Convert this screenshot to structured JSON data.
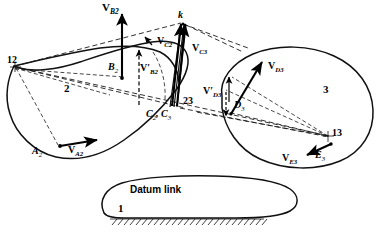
{
  "figure": {
    "background_color": "#ffffff",
    "line_color": "#111111"
  },
  "links": [
    {
      "id": "link2",
      "number_label": "2",
      "name": "link-2"
    },
    {
      "id": "link3",
      "number_label": "3",
      "name": "link-3"
    },
    {
      "id": "link1",
      "number_label": "1",
      "name": "datum-link",
      "text": "Datum link"
    }
  ],
  "datum": {
    "label": "Datum link",
    "number": "1"
  },
  "instant_centers": [
    {
      "label": "12",
      "name": "instant-center-12",
      "x": 14,
      "y": 65
    },
    {
      "label": "23",
      "name": "instant-center-23",
      "x": 176,
      "y": 103
    },
    {
      "label": "13",
      "name": "instant-center-13",
      "x": 329,
      "y": 136
    }
  ],
  "points": [
    {
      "label": "B",
      "sub": "2",
      "name": "point-b2"
    },
    {
      "label": "A",
      "sub": "2",
      "name": "point-a2"
    },
    {
      "label": "C",
      "sub": "2",
      "name": "point-c2"
    },
    {
      "label": "C",
      "sub": "3",
      "name": "point-c3"
    },
    {
      "label": "D",
      "sub": "3",
      "name": "point-d3"
    },
    {
      "label": "E",
      "sub": "3",
      "name": "point-e3"
    },
    {
      "label": "k",
      "name": "point-k"
    }
  ],
  "point_pair_label": {
    "prefix": "C",
    "sub1": "2",
    "mid": ", ",
    "letter2": "C",
    "sub2": "3"
  },
  "vectors": [
    {
      "label": "V",
      "sub": "B₂",
      "name": "vector-vb2",
      "display": "V_B2"
    },
    {
      "label": "V",
      "sub": "A₂",
      "name": "vector-va2",
      "display": "V_A2"
    },
    {
      "label": "V",
      "sub": "C₂",
      "name": "vector-vc2",
      "display": "V_C2"
    },
    {
      "label": "V",
      "sub": "C₃",
      "name": "vector-vc3",
      "display": "V_C3"
    },
    {
      "label": "V",
      "sub": "D₃",
      "name": "vector-vd3",
      "display": "V_D3"
    },
    {
      "label": "V",
      "sub": "E₃",
      "name": "vector-ve3",
      "display": "V_E3"
    }
  ],
  "primed_vectors": [
    {
      "label": "V'",
      "sub": "B₂",
      "name": "vector-vb2-prime",
      "display": "V'_B2"
    },
    {
      "label": "V'",
      "sub": "D₃",
      "name": "vector-vd3-prime",
      "display": "V'_D3"
    }
  ],
  "labels": {
    "v_b2": {
      "v": "V",
      "s": "B",
      "ss": "2"
    },
    "v_a2": {
      "v": "V",
      "s": "A",
      "ss": "2"
    },
    "v_c2": {
      "v": "V",
      "s": "C",
      "ss": "2"
    },
    "v_c3": {
      "v": "V",
      "s": "C",
      "ss": "3"
    },
    "v_d3": {
      "v": "V",
      "s": "D",
      "ss": "3"
    },
    "v_e3": {
      "v": "V",
      "s": "E",
      "ss": "3"
    },
    "vp_b2": {
      "v": "V′",
      "s": "B",
      "ss": "2"
    },
    "vp_d3": {
      "v": "V′",
      "s": "D",
      "ss": "3"
    },
    "b2": {
      "p": "B",
      "s": "2"
    },
    "a2": {
      "p": "A",
      "s": "2"
    },
    "d3": {
      "p": "D",
      "s": "3"
    },
    "e3": {
      "p": "E",
      "s": "3"
    },
    "c2": {
      "p": "C",
      "s": "2"
    },
    "c3": {
      "p": "C",
      "s": "3"
    },
    "k": {
      "p": "k"
    },
    "ic12": "12",
    "ic23": "23",
    "ic13": "13",
    "link2_num": "2",
    "link3_num": "3",
    "link1_num": "1",
    "datum_text": "Datum link",
    "comma": ","
  }
}
